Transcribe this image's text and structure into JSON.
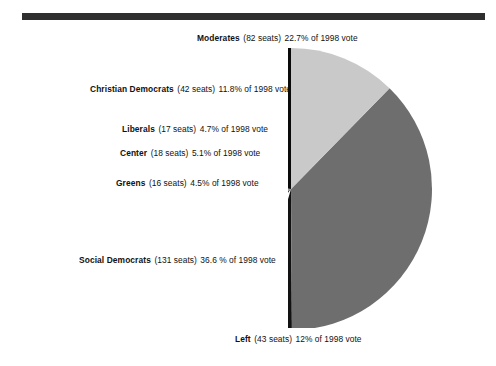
{
  "figure": {
    "kind": "pie-chart-figure",
    "background_color": "#ffffff",
    "rule_color": "#2f2f2f"
  },
  "chart_data": {
    "type": "pie",
    "title": "",
    "xlabel": "",
    "ylabel": "",
    "legend_position": "callout-labels-left",
    "grid": false,
    "units": "% of 1998 vote",
    "categories": [
      "Moderates",
      "Christian Democrats",
      "Liberals",
      "Center",
      "Greens",
      "Social Democrats",
      "Left"
    ],
    "values": [
      22.7,
      11.8,
      4.7,
      5.1,
      4.5,
      36.6,
      12
    ],
    "seats": [
      82,
      42,
      17,
      18,
      16,
      131,
      43
    ],
    "colors": [
      "#0a0a0a",
      "#9e9e9e",
      "#3a3a3a",
      "#ffffff",
      "#121212",
      "#6e6e6e",
      "#c9c9c9"
    ],
    "start_angle_deg": 0,
    "direction": "counterclockwise"
  },
  "labels": [
    {
      "key": "moderates",
      "party": "Moderates",
      "seats": "(82 seats)",
      "share": "22.7% of 1998 vote"
    },
    {
      "key": "christian-democrats",
      "party": "Christian Democrats",
      "seats": "(42 seats)",
      "share": "11.8% of 1998 vote"
    },
    {
      "key": "liberals",
      "party": "Liberals",
      "seats": "(17 seats)",
      "share": "4.7% of 1998 vote"
    },
    {
      "key": "center",
      "party": "Center",
      "seats": "(18 seats)",
      "share": "5.1% of 1998 vote"
    },
    {
      "key": "greens",
      "party": "Greens",
      "seats": "(16 seats)",
      "share": "4.5% of 1998 vote"
    },
    {
      "key": "social-democrats",
      "party": "Social Democrats",
      "seats": "(131 seats)",
      "share": "36.6 % of 1998 vote"
    },
    {
      "key": "left",
      "party": "Left",
      "seats": "(43 seats)",
      "share": "12% of 1998 vote"
    }
  ]
}
